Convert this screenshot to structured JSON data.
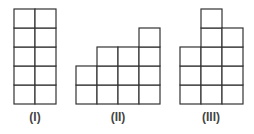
{
  "figure": {
    "cell_width": 21,
    "cell_height": 19,
    "baseline_y": 104,
    "stroke_color": "#333333",
    "label_color": "#444444",
    "shapes": [
      {
        "label": "(I)",
        "origin_x": 14,
        "label_x": 35,
        "column_heights": [
          5,
          5
        ]
      },
      {
        "label": "(II)",
        "origin_x": 76,
        "label_x": 118,
        "column_heights": [
          2,
          3,
          3,
          4
        ]
      },
      {
        "label": "(III)",
        "origin_x": 180,
        "label_x": 211,
        "column_heights": [
          3,
          5,
          4
        ]
      }
    ]
  }
}
